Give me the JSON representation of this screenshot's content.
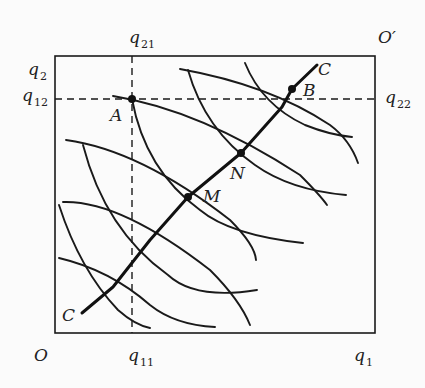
{
  "diagram": {
    "type": "edgeworth-box",
    "box": {
      "origin_label": "O",
      "opposite_origin_label": "O′"
    },
    "axis_labels": {
      "x_axis_end": {
        "base": "q",
        "sub": "1"
      },
      "y_axis_end": {
        "base": "q",
        "sub": "2"
      },
      "q11": {
        "base": "q",
        "sub": "11"
      },
      "q12": {
        "base": "q",
        "sub": "12"
      },
      "q21": {
        "base": "q",
        "sub": "21"
      },
      "q22": {
        "base": "q",
        "sub": "22"
      }
    },
    "points": {
      "A": "A",
      "B": "B",
      "M": "M",
      "N": "N"
    },
    "contract_curve": {
      "start_label": "C",
      "end_label": "C"
    },
    "colors": {
      "line": "#1a1a1a",
      "background": "#fbfbfb"
    }
  }
}
